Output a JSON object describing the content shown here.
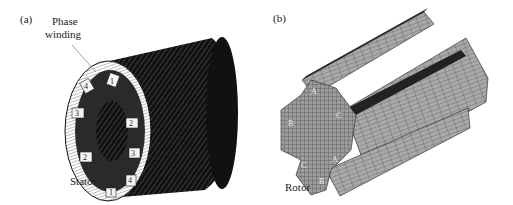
{
  "panels": [
    {
      "id": "a",
      "tag": "(a)",
      "labels": {
        "winding_line1": "Phase",
        "winding_line2": "winding",
        "stator": "Stator"
      },
      "phase_numbers": [
        "1",
        "2",
        "3",
        "4",
        "1",
        "2",
        "3",
        "4"
      ]
    },
    {
      "id": "b",
      "tag": "(b)",
      "labels": {
        "rotor": "Rotor"
      },
      "pole_letters": [
        "A",
        "B",
        "C",
        "A",
        "B",
        "C"
      ]
    }
  ]
}
